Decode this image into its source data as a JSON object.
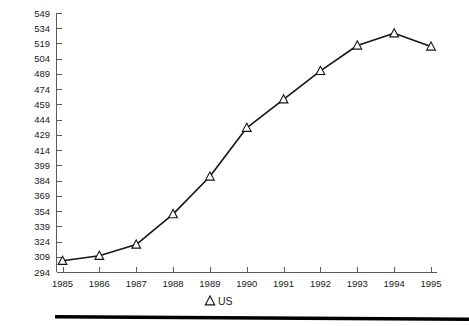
{
  "chart_data": {
    "type": "line",
    "title": "",
    "subtitle": "",
    "xlabel": "",
    "ylabel": "",
    "categories": [
      "1985",
      "1986",
      "1987",
      "1988",
      "1989",
      "1990",
      "1991",
      "1992",
      "1993",
      "1994",
      "1995"
    ],
    "x": [
      1985,
      1986,
      1987,
      1988,
      1989,
      1990,
      1991,
      1992,
      1993,
      1994,
      1995
    ],
    "series": [
      {
        "name": "US",
        "marker": "open-triangle",
        "color": "#151515",
        "values": [
          305,
          310,
          321,
          351,
          388,
          436,
          464,
          492,
          517,
          529,
          516
        ]
      }
    ],
    "ylim": [
      294,
      549
    ],
    "xlim": [
      1985,
      1995
    ],
    "yticks": [
      294,
      309,
      324,
      339,
      354,
      369,
      384,
      399,
      414,
      429,
      444,
      459,
      474,
      489,
      504,
      519,
      534,
      549
    ],
    "ytick_labels": [
      "294",
      "309",
      "324",
      "339",
      "354",
      "369",
      "384",
      "399",
      "414",
      "429",
      "444",
      "459",
      "474",
      "489",
      "504",
      "519",
      "534",
      "549"
    ],
    "xtick_labels": [
      "1985",
      "1986",
      "1987",
      "1988",
      "1989",
      "1990",
      "1991",
      "1992",
      "1993",
      "1994",
      "1995"
    ],
    "grid": false,
    "legend_position": "bottom-center",
    "legend": [
      {
        "label": "US",
        "marker": "open-triangle"
      }
    ]
  },
  "legend": {
    "us_label": "US"
  },
  "axis": {
    "y_title": "",
    "x_title": ""
  }
}
